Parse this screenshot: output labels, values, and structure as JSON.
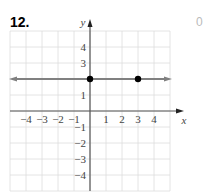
{
  "problem": {
    "number": "12.",
    "side_mark": "0"
  },
  "chart_data": {
    "type": "line",
    "title": "",
    "xlabel": "x",
    "ylabel": "y",
    "xlim": [
      -5,
      5
    ],
    "ylim": [
      -5,
      5
    ],
    "grid": true,
    "x_tick_labels": [
      "−4",
      "−3",
      "−2",
      "−1",
      "1",
      "2",
      "3",
      "4"
    ],
    "y_tick_labels": [
      "4",
      "3",
      "1",
      "−1",
      "−2",
      "−3",
      "−4"
    ],
    "series": [
      {
        "name": "y = 2",
        "type": "line",
        "equation": "y = 2",
        "x": [
          -5,
          5
        ],
        "y": [
          2,
          2
        ],
        "arrows": "both",
        "color": "#808080"
      },
      {
        "name": "points",
        "type": "scatter",
        "x": [
          0,
          3
        ],
        "y": [
          2,
          2
        ],
        "color": "#000000"
      }
    ],
    "legend": null
  },
  "colors": {
    "grid": "#dddddd",
    "axis": "#555555",
    "line": "#808080",
    "point": "#000000"
  }
}
